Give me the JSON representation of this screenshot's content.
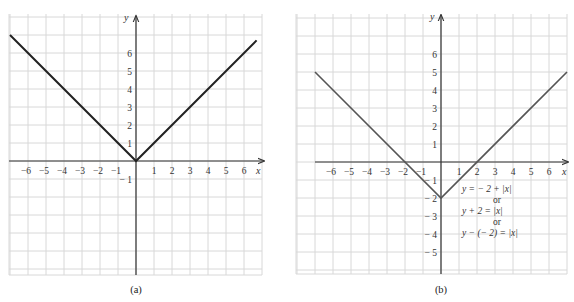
{
  "chart_data": [
    {
      "id": "a",
      "type": "line",
      "caption": "(a)",
      "title": "",
      "xlabel": "x",
      "ylabel": "y",
      "function": "y = |x|",
      "xlim": [
        -7,
        7
      ],
      "ylim": [
        -6,
        7.7
      ],
      "grid": true,
      "x_ticks": [
        "-6",
        "-5",
        "-4",
        "-3",
        "-2",
        "-1",
        "1",
        "2",
        "3",
        "4",
        "5",
        "6"
      ],
      "y_ticks": [
        "1",
        "2",
        "3",
        "4",
        "5",
        "6",
        "-1"
      ],
      "series": [
        {
          "name": "y = |x|",
          "color": "#222222",
          "x": [
            -7,
            0,
            6.7
          ],
          "y": [
            7,
            0,
            6.7
          ]
        }
      ],
      "vertex": [
        0,
        0
      ]
    },
    {
      "id": "b",
      "type": "line",
      "caption": "(b)",
      "title": "",
      "xlabel": "x",
      "ylabel": "y",
      "function": "y = -2 + |x|",
      "xlim": [
        -8,
        7
      ],
      "ylim": [
        -6,
        7.7
      ],
      "grid": true,
      "x_ticks": [
        "-6",
        "-5",
        "-4",
        "-3",
        "-2",
        "-1",
        "1",
        "2",
        "3",
        "4",
        "5",
        "6"
      ],
      "y_ticks": [
        "1",
        "2",
        "3",
        "4",
        "5",
        "6",
        "-1",
        "-2",
        "-3",
        "-4",
        "-5"
      ],
      "series": [
        {
          "name": "y = -2 + |x|",
          "color": "#555555",
          "x": [
            -7,
            0,
            7
          ],
          "y": [
            5,
            -2,
            5
          ]
        }
      ],
      "vertex": [
        0,
        -2
      ],
      "annotations": [
        "y = − 2 + |x|",
        "or",
        "y + 2 = |x|",
        "or",
        "y − (− 2) = |x|"
      ]
    }
  ]
}
